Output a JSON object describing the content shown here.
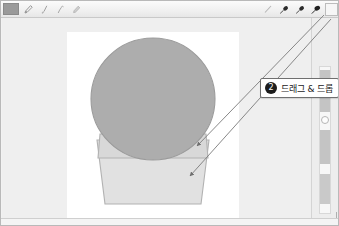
{
  "window": {
    "title": "Drawing Canvas",
    "background_color": "#efefef",
    "frame_color": "#b9b9b9"
  },
  "toolbar": {
    "background_color": "#f0f0f0",
    "document_label": "Document",
    "left_tools": [
      {
        "name": "pen-tool",
        "label": "Pen",
        "selected": false
      },
      {
        "name": "brush-tool",
        "label": "Brush",
        "selected": false
      },
      {
        "name": "ink-tool",
        "label": "Ink Pen",
        "selected": false
      },
      {
        "name": "marker-tool",
        "label": "Marker",
        "selected": false
      }
    ],
    "right_tools": [
      {
        "name": "eraser-tool",
        "label": "Eraser",
        "selected": false
      },
      {
        "name": "brush-tip-1",
        "label": "Brush Tip 1",
        "color": "#2b2b2b"
      },
      {
        "name": "brush-tip-2",
        "label": "Brush Tip 2",
        "color": "#2b2b2b"
      },
      {
        "name": "brush-tip-3",
        "label": "Brush Tip 3",
        "color": "#1f1f1f"
      }
    ],
    "color_well_label": "Color"
  },
  "canvas": {
    "background_color": "#ffffff",
    "artwork_title": "Snow Globe",
    "sphere": {
      "label": "Globe Sphere",
      "fill": "#adadad",
      "stroke": "#9b9b9b"
    },
    "base_band": {
      "label": "Globe Collar",
      "fill": "#d6d6d6",
      "stroke": "#b2b2b2"
    },
    "base": {
      "label": "Globe Base",
      "fill": "#e1e1e1",
      "stroke": "#b2b2b2"
    }
  },
  "callout": {
    "badge": "2",
    "text": "드래그 & 드롭",
    "border_color": "#6f6f6f",
    "badge_color": "#1d1d1d"
  },
  "arrows": {
    "color": "#7a7a7a",
    "count": 2,
    "source_label": "Brush Tool",
    "target_label": "Globe Base"
  },
  "right_panel": {
    "label": "Layers Panel",
    "scrollbar_label": "Vertical Scrollbar",
    "resize_label": "Resize Handle"
  }
}
